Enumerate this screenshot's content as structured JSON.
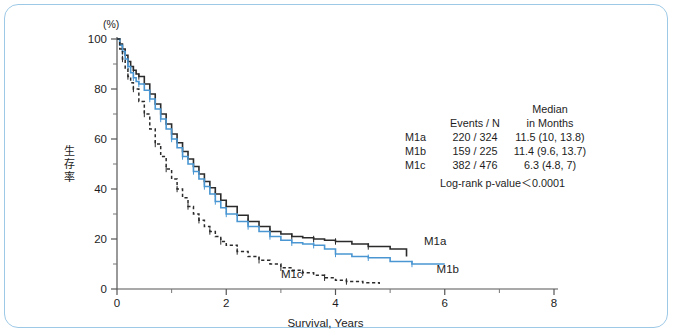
{
  "figure": {
    "border_color": "#9ec9e6",
    "background": "#ffffff"
  },
  "chart_data": {
    "type": "line",
    "subtype": "kaplan-meier-survival",
    "title": "",
    "xlabel": "Survival, Years",
    "ylabel": "生存率",
    "y_unit_label": "(%)",
    "xlim": [
      0,
      8
    ],
    "ylim": [
      0,
      100
    ],
    "xticks": [
      0,
      2,
      4,
      6,
      8
    ],
    "xticklabels": [
      "0",
      "2",
      "4",
      "6",
      "8"
    ],
    "x_minor_ticks": [
      1,
      3,
      5,
      7
    ],
    "yticks": [
      0,
      20,
      40,
      60,
      80,
      100
    ],
    "yticklabels": [
      "0",
      "20",
      "40",
      "60",
      "80",
      "100"
    ],
    "y_minor_ticks": [
      10,
      30,
      50,
      70,
      90
    ],
    "grid": false,
    "legend_position": "none",
    "series": [
      {
        "name": "M1a",
        "color": "#2b2b2b",
        "style": "solid",
        "label_x": 5.62,
        "label_y": 17.5,
        "x": [
          0,
          0.05,
          0.1,
          0.15,
          0.2,
          0.25,
          0.3,
          0.35,
          0.4,
          0.5,
          0.6,
          0.7,
          0.8,
          0.9,
          1.0,
          1.1,
          1.2,
          1.3,
          1.4,
          1.5,
          1.6,
          1.7,
          1.8,
          1.9,
          2.0,
          2.2,
          2.4,
          2.6,
          2.8,
          3.0,
          3.2,
          3.4,
          3.6,
          3.8,
          4.0,
          4.3,
          4.6,
          5.0,
          5.3
        ],
        "y": [
          100,
          98,
          96,
          93.5,
          91,
          89,
          87.5,
          86,
          85,
          82,
          78,
          74,
          70,
          66,
          62,
          58.5,
          55,
          52,
          49,
          46,
          43,
          40.5,
          38,
          35.5,
          33,
          29.5,
          27,
          25,
          23,
          22,
          21,
          20.5,
          20,
          19.5,
          19,
          18,
          17,
          16,
          13
        ]
      },
      {
        "name": "M1b",
        "color": "#4a96d2",
        "style": "solid",
        "label_x": 5.85,
        "label_y": 6.5,
        "x": [
          0,
          0.05,
          0.1,
          0.15,
          0.2,
          0.25,
          0.3,
          0.35,
          0.4,
          0.5,
          0.6,
          0.7,
          0.8,
          0.9,
          1.0,
          1.1,
          1.2,
          1.3,
          1.4,
          1.5,
          1.6,
          1.7,
          1.8,
          1.9,
          2.0,
          2.2,
          2.4,
          2.6,
          2.8,
          3.0,
          3.2,
          3.4,
          3.6,
          3.8,
          4.0,
          4.3,
          4.6,
          5.0,
          5.4,
          6.0
        ],
        "y": [
          100,
          97.5,
          95,
          92,
          89,
          86.5,
          84.5,
          83,
          82,
          79.5,
          76,
          72,
          68,
          64,
          60,
          56.5,
          53,
          50,
          47,
          44,
          41,
          38,
          35,
          32.5,
          30,
          27,
          25,
          23,
          21,
          19.5,
          18.5,
          18,
          17.5,
          16,
          14,
          13,
          12.5,
          11,
          10,
          10
        ]
      },
      {
        "name": "M1c",
        "color": "#2b2b2b",
        "style": "dotted",
        "label_x": 3.0,
        "label_y": 4.5,
        "x": [
          0,
          0.05,
          0.1,
          0.15,
          0.2,
          0.25,
          0.3,
          0.4,
          0.5,
          0.6,
          0.7,
          0.8,
          0.9,
          1.0,
          1.1,
          1.2,
          1.3,
          1.4,
          1.5,
          1.6,
          1.7,
          1.8,
          1.9,
          2.0,
          2.2,
          2.4,
          2.6,
          2.8,
          3.0,
          3.2,
          3.4,
          3.6,
          3.8,
          4.0,
          4.2,
          4.5,
          4.8
        ],
        "y": [
          100,
          96,
          92,
          88,
          85,
          82.5,
          80,
          75,
          70,
          64,
          58,
          53,
          48,
          44,
          40,
          36.5,
          33,
          30,
          27.5,
          25,
          23,
          21,
          19,
          17.5,
          15,
          13,
          11.5,
          10,
          8.5,
          7.5,
          6.5,
          5.5,
          4.5,
          3.5,
          3.0,
          2.5,
          2.0
        ]
      }
    ]
  },
  "stats": {
    "header": {
      "events_n": "Events / N",
      "median_line1": "Median",
      "median_line2": "in Months"
    },
    "rows": [
      {
        "group": "M1a",
        "events_n": "220 / 324",
        "median": "11.5  (10, 13.8)"
      },
      {
        "group": "M1b",
        "events_n": "159 / 225",
        "median": "11.4  (9.6, 13.7)"
      },
      {
        "group": "M1c",
        "events_n": "382 / 476",
        "median": "6.3  (4.8, 7)"
      }
    ],
    "pvalue": "Log-rank p-value＜0.0001"
  }
}
